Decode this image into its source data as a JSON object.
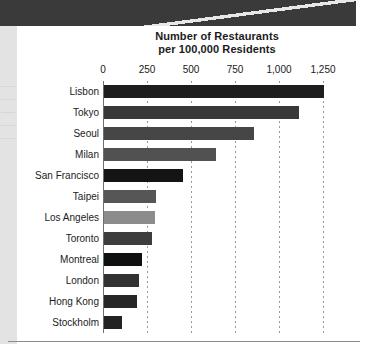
{
  "page": {
    "banner_label": "page-top-banner",
    "left_strip_label": "page-left-margin"
  },
  "chart_data": {
    "type": "bar",
    "orientation": "horizontal",
    "title": "Number of Restaurants per 100,000 Residents",
    "title_line1": "Number of Restaurants",
    "title_line2": "per 100,000 Residents",
    "xlabel": "",
    "ylabel": "",
    "xlim": [
      0,
      1350
    ],
    "xticks": [
      0,
      250,
      500,
      750,
      1000,
      1250
    ],
    "xtick_labels": [
      "0",
      "250",
      "500",
      "750",
      "1,000",
      "1,250"
    ],
    "grid": "vertical-dotted",
    "legend": "none",
    "categories": [
      "Lisbon",
      "Tokyo",
      "Seoul",
      "Milan",
      "San Francisco",
      "Taipei",
      "Los Angeles",
      "Toronto",
      "Montreal",
      "London",
      "Hong Kong",
      "Stockholm"
    ],
    "values": [
      1250,
      1110,
      850,
      635,
      450,
      295,
      290,
      270,
      215,
      200,
      190,
      105
    ],
    "bar_colors": [
      "#1e1e1e",
      "#383838",
      "#464646",
      "#515151",
      "#141414",
      "#565656",
      "#8c8c8c",
      "#3d3d3d",
      "#101010",
      "#323232",
      "#262626",
      "#222222"
    ]
  }
}
